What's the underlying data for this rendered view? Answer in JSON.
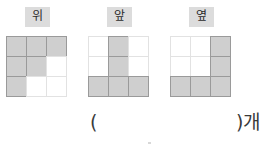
{
  "problem": {
    "answer_unit_prefix": "(",
    "answer_unit_suffix": ")개",
    "answer_value": ""
  },
  "views": [
    {
      "id": "top-view",
      "label": "위",
      "grid": {
        "rows": 3,
        "cols": 3,
        "cells": [
          [
            1,
            1,
            1
          ],
          [
            1,
            1,
            0
          ],
          [
            1,
            0,
            0
          ]
        ]
      }
    },
    {
      "id": "front-view",
      "label": "앞",
      "grid": {
        "rows": 3,
        "cols": 3,
        "cells": [
          [
            0,
            1,
            0
          ],
          [
            0,
            1,
            0
          ],
          [
            1,
            1,
            1
          ]
        ]
      }
    },
    {
      "id": "side-view",
      "label": "옆",
      "grid": {
        "rows": 3,
        "cols": 3,
        "cells": [
          [
            0,
            0,
            1
          ],
          [
            0,
            0,
            1
          ],
          [
            1,
            1,
            1
          ]
        ]
      }
    }
  ],
  "colors": {
    "filled_cell": "#cfcfcf",
    "filled_border": "#9a9a9a",
    "empty_border": "#e2e2e2",
    "label_background": "#dcdcdc",
    "text": "#2b2b2b"
  }
}
